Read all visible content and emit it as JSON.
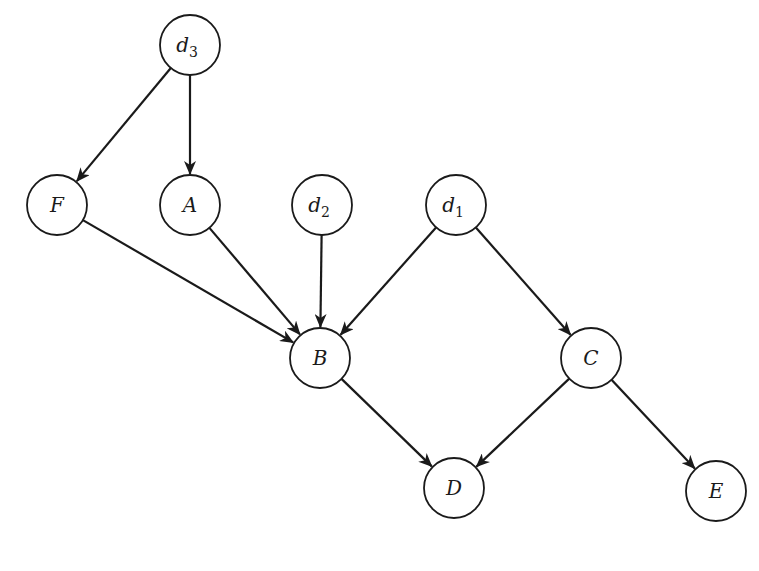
{
  "diagram": {
    "type": "directed-acyclic-graph",
    "node_radius": 30,
    "stroke_color": "#1a1a1a",
    "nodes": [
      {
        "id": "d3",
        "label": "d",
        "sub": "3",
        "x": 190,
        "y": 45
      },
      {
        "id": "F",
        "label": "F",
        "sub": "",
        "x": 57,
        "y": 205
      },
      {
        "id": "A",
        "label": "A",
        "sub": "",
        "x": 190,
        "y": 205
      },
      {
        "id": "d2",
        "label": "d",
        "sub": "2",
        "x": 322,
        "y": 205
      },
      {
        "id": "d1",
        "label": "d",
        "sub": "1",
        "x": 456,
        "y": 205
      },
      {
        "id": "B",
        "label": "B",
        "sub": "",
        "x": 320,
        "y": 358
      },
      {
        "id": "C",
        "label": "C",
        "sub": "",
        "x": 591,
        "y": 358
      },
      {
        "id": "D",
        "label": "D",
        "sub": "",
        "x": 454,
        "y": 488
      },
      {
        "id": "E",
        "label": "E",
        "sub": "",
        "x": 716,
        "y": 491
      }
    ],
    "edges": [
      {
        "from": "d3",
        "to": "F"
      },
      {
        "from": "d3",
        "to": "A"
      },
      {
        "from": "F",
        "to": "B"
      },
      {
        "from": "A",
        "to": "B"
      },
      {
        "from": "d2",
        "to": "B"
      },
      {
        "from": "d1",
        "to": "B"
      },
      {
        "from": "d1",
        "to": "C"
      },
      {
        "from": "B",
        "to": "D"
      },
      {
        "from": "C",
        "to": "D"
      },
      {
        "from": "C",
        "to": "E"
      }
    ]
  }
}
